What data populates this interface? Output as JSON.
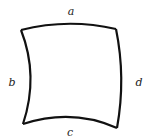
{
  "diagram": {
    "shape": "curvilinear quadrilateral",
    "stroke_color": "#111111",
    "edges": [
      {
        "id": "top",
        "label": "a"
      },
      {
        "id": "left",
        "label": "b"
      },
      {
        "id": "bottom",
        "label": "c"
      },
      {
        "id": "right",
        "label": "d"
      }
    ]
  }
}
